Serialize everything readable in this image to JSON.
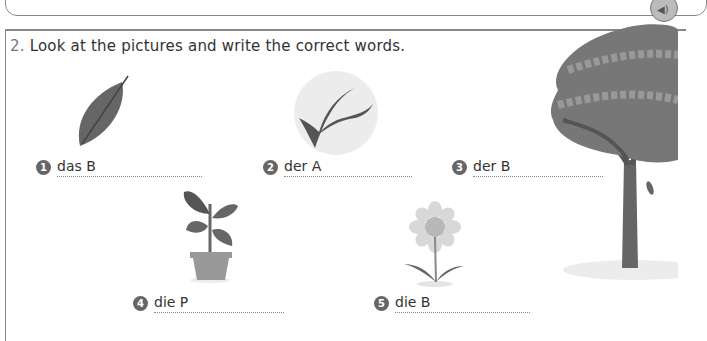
{
  "previous_section": {
    "audio_icon": "speaker-icon"
  },
  "exercise": {
    "number": "2.",
    "instruction": "Look at the pictures and write the correct words."
  },
  "items": [
    {
      "number": "1",
      "prefix": "das B",
      "picture": "leaf"
    },
    {
      "number": "2",
      "prefix": "der A",
      "picture": "branch"
    },
    {
      "number": "3",
      "prefix": "der B",
      "picture": "tree"
    },
    {
      "number": "4",
      "prefix": "die P",
      "picture": "potted-plant"
    },
    {
      "number": "5",
      "prefix": "die B",
      "picture": "flower"
    }
  ]
}
